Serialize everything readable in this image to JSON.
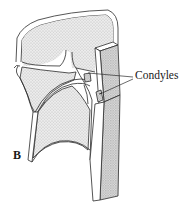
{
  "figure": {
    "panel_letter": "B",
    "labels": [
      {
        "text": "Condyles",
        "pointer_count": 2
      }
    ],
    "style": {
      "line_color": "#2b2b2b",
      "stipple_fill": "#d9d9d9",
      "dark_stipple_fill": "#c8c8c8",
      "background": "#ffffff"
    }
  }
}
